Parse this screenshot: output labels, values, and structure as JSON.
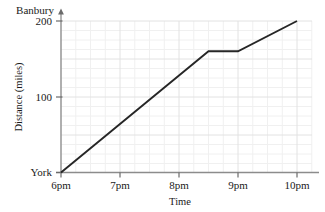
{
  "chart_data": {
    "type": "line",
    "title": "",
    "xlabel": "Time",
    "ylabel": "Distance (miles)",
    "x_tick_labels": [
      "6pm",
      "7pm",
      "8pm",
      "9pm",
      "10pm"
    ],
    "x_tick_values": [
      18,
      19,
      20,
      21,
      22
    ],
    "y_tick_labels": [
      "100",
      "200"
    ],
    "y_tick_values": [
      100,
      200
    ],
    "y_origin_label": "York",
    "y_top_label": "Banbury",
    "xlim": [
      18,
      22
    ],
    "ylim": [
      0,
      200
    ],
    "grid": true,
    "grid_minor": true,
    "legend": "none",
    "series": [
      {
        "name": "Journey York to Banbury",
        "x": [
          18,
          20.5,
          21,
          22
        ],
        "y": [
          0,
          160,
          160,
          200
        ],
        "point_labels": [
          "6pm, 0 miles",
          "8:30pm, 160 miles",
          "9pm, 160 miles",
          "10pm, 200 miles"
        ],
        "color": "#262626"
      }
    ]
  },
  "axes": {
    "y_axis_top_label": "Banbury",
    "y_axis_title": "Distance (miles)",
    "y_axis_origin_label": "York",
    "y_tick_200": "200",
    "y_tick_100": "100",
    "x_axis_title": "Time",
    "x_tick_6pm": "6pm",
    "x_tick_7pm": "7pm",
    "x_tick_8pm": "8pm",
    "x_tick_9pm": "9pm",
    "x_tick_10pm": "10pm"
  },
  "colors": {
    "line": "#262626",
    "axis": "#8c8c8c",
    "grid_major": "#e3e3e3",
    "grid_minor": "#efefef",
    "background": "#ffffff",
    "text": "#1a1a1a"
  }
}
